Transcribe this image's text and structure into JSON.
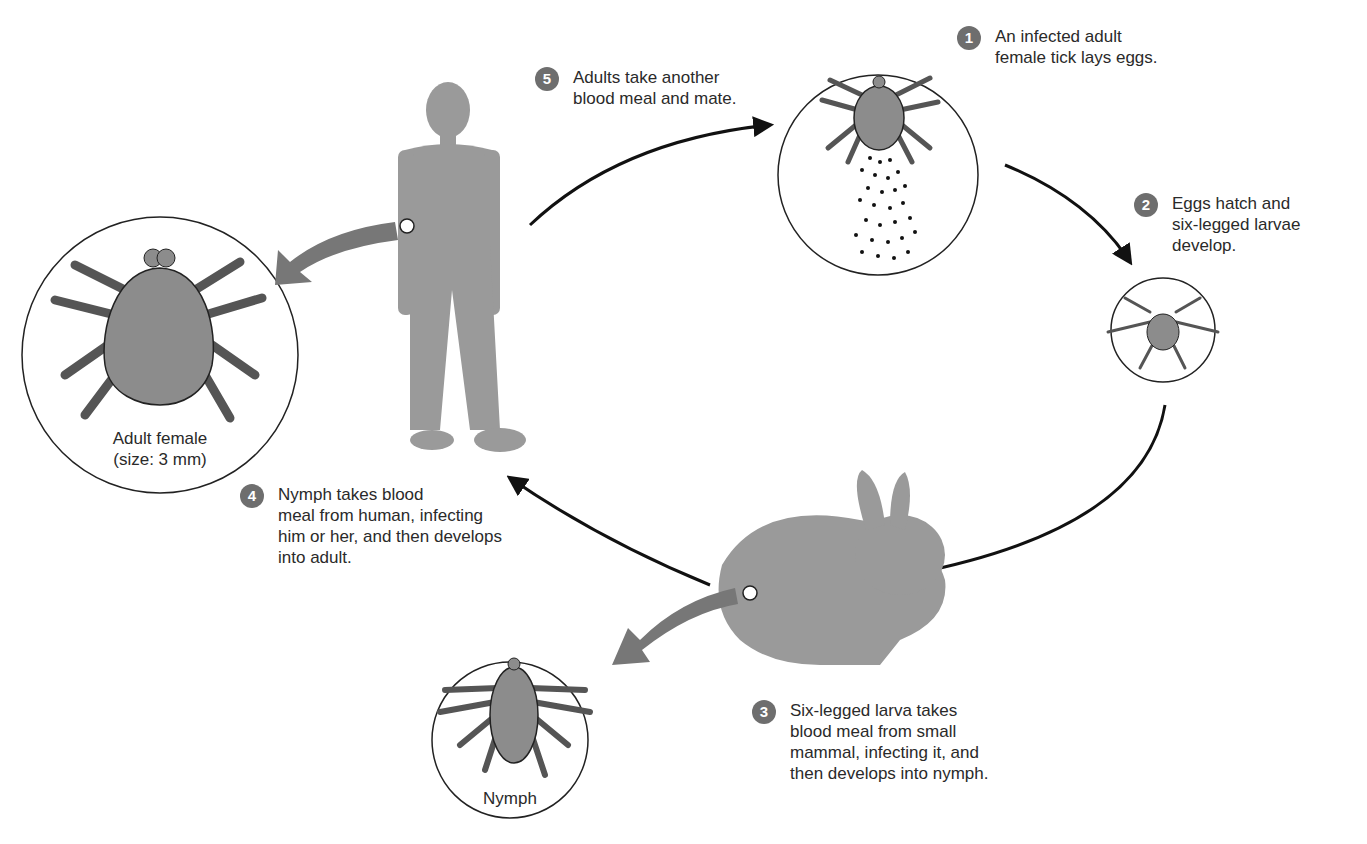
{
  "diagram": {
    "steps": [
      {
        "number": "1",
        "lines": [
          "An infected adult",
          "female tick lays eggs."
        ]
      },
      {
        "number": "2",
        "lines": [
          "Eggs hatch and",
          "six-legged larvae",
          "develop."
        ]
      },
      {
        "number": "3",
        "lines": [
          "Six-legged larva takes",
          "blood meal from small",
          "mammal, infecting it, and",
          "then develops into nymph."
        ]
      },
      {
        "number": "4",
        "lines": [
          "Nymph takes blood",
          "meal from human, infecting",
          "him or her, and then develops",
          "into adult."
        ]
      },
      {
        "number": "5",
        "lines": [
          "Adults take another",
          "blood meal and mate."
        ]
      }
    ],
    "captions": {
      "adult_female": [
        "Adult female",
        "(size: 3 mm)"
      ],
      "nymph": "Nymph"
    },
    "colors": {
      "badge": "#6e6e6e",
      "figure": "#9a9a9a",
      "tick_body": "#8c8c8c",
      "arrow": "#111111",
      "callout_arrow": "#777777"
    }
  }
}
